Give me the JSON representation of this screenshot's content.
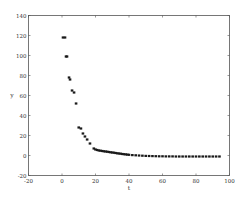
{
  "chart_data": {
    "type": "scatter",
    "title": "",
    "xlabel": "t",
    "ylabel": "y",
    "xlim": [
      -20,
      100
    ],
    "ylim": [
      -20,
      140
    ],
    "xticks": [
      -20,
      0,
      20,
      40,
      60,
      80,
      100
    ],
    "yticks": [
      -20,
      0,
      20,
      40,
      60,
      80,
      100,
      120,
      140
    ],
    "grid": false,
    "legend": null,
    "marker_color": "#1a1a1a",
    "series": [
      {
        "name": "y(t)",
        "x": [
          0.6,
          1.8,
          2.4,
          3.0,
          4.2,
          4.8,
          6.0,
          7.2,
          8.4,
          10.0,
          11.3,
          12.5,
          13.7,
          15.0,
          16.7,
          19,
          20,
          21,
          22,
          23,
          24,
          25,
          26,
          27,
          28,
          29,
          30,
          31,
          32,
          33,
          34,
          35,
          36,
          37,
          38,
          39,
          40,
          42,
          44,
          46,
          48,
          50,
          52,
          54,
          56,
          58,
          60,
          62,
          64,
          66,
          68,
          70,
          72,
          74,
          76,
          78,
          80,
          82,
          84,
          86,
          88,
          90,
          92,
          94
        ],
        "y": [
          118,
          118,
          99,
          99,
          78,
          76,
          65,
          63,
          52,
          28,
          27,
          22,
          19,
          16,
          12,
          7,
          6,
          5.5,
          5,
          4.8,
          4.5,
          4.2,
          4,
          3.8,
          3.5,
          3.2,
          3,
          2.8,
          2.5,
          2.2,
          2,
          1.8,
          1.5,
          1.3,
          1.1,
          0.9,
          0.7,
          0.4,
          0.2,
          0,
          -0.2,
          -0.4,
          -0.5,
          -0.6,
          -0.7,
          -0.8,
          -0.8,
          -0.9,
          -0.9,
          -0.9,
          -1,
          -1,
          -1,
          -1,
          -1,
          -1,
          -1,
          -1,
          -1,
          -1,
          -1,
          -1,
          -1,
          -1
        ]
      }
    ]
  }
}
